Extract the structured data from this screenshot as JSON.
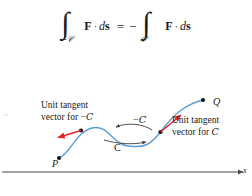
{
  "figure": {
    "equation": {
      "left_integral": {
        "symbol": "∫",
        "subscript": "−𝒞",
        "integrand_vector": "F",
        "dot": "·",
        "differential": "d",
        "differential_vector": "s"
      },
      "relation": "=",
      "sign": "−",
      "right_integral": {
        "symbol": "∫",
        "subscript": "𝒞",
        "integrand_vector": "F",
        "dot": "·",
        "differential": "d",
        "differential_vector": "s"
      },
      "plain_text": "∫_{−C} F · ds = − ∫_{C} F · ds"
    },
    "diagram": {
      "labels": {
        "unit_tangent_negative_line1": "Unit tangent",
        "unit_tangent_negative_line2": "vector for −",
        "unit_tangent_negative_curve": "C",
        "unit_tangent_positive_line1": "Unit tangent",
        "unit_tangent_positive_line2": "vector for",
        "unit_tangent_positive_curve": "C",
        "curve_negative": "−",
        "curve_negative_symbol": "C",
        "curve_positive_symbol": "C",
        "point_start": "P",
        "point_end": "Q",
        "axis_x": "x"
      },
      "colors": {
        "curve": "#5b9bd5",
        "tangent_arrow": "#e8262a",
        "direction_arrow": "#3a3a3a",
        "point_marker": "#111111",
        "axis": "#4a4a4a",
        "text": "#1a1a1a"
      }
    }
  }
}
